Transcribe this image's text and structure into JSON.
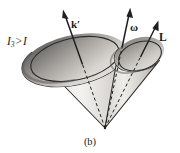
{
  "figure": {
    "caption": "(b)",
    "background_color": "#ffffff",
    "ink_color": "#1a1a1a",
    "labels": {
      "inequality": {
        "symbol": "I",
        "subscript": "3",
        "relation": ">",
        "compared_to": "I",
        "full_text": "I3 > I"
      },
      "vector_k_prime": "k′",
      "vector_omega": "ω",
      "vector_angular_momentum": "L"
    },
    "geometry": {
      "apex": {
        "x": 105,
        "y": 128
      },
      "space_cone": {
        "name": "space-cone",
        "rim_center": {
          "x": 75,
          "y": 59
        },
        "rim_rx": 45,
        "rim_ry": 21,
        "rim_rotation_deg": -12,
        "fill_light": "#f2f0ee",
        "fill_mid": "#b9b6b2",
        "fill_dark": "#6f6d6a"
      },
      "body_cone": {
        "name": "body-cone",
        "rim_center": {
          "x": 140,
          "y": 56
        },
        "rim_rx": 22,
        "rim_ry": 14,
        "rim_rotation_deg": -18,
        "fill_light": "#f4f2f0",
        "fill_mid": "#c2bfbb",
        "fill_dark": "#7a7875"
      },
      "arrows": [
        {
          "name": "k-prime-arrow",
          "label": "k′",
          "tail": {
            "x": 105,
            "y": 128
          },
          "tip": {
            "x": 63,
            "y": 10
          },
          "dashed_inside_cone": true
        },
        {
          "name": "omega-arrow",
          "label": "ω",
          "tail": {
            "x": 105,
            "y": 128
          },
          "tip": {
            "x": 130,
            "y": 8
          },
          "dashed_inside_cone": true
        },
        {
          "name": "angular-momentum-arrow",
          "label": "L",
          "tail": {
            "x": 105,
            "y": 128
          },
          "tip": {
            "x": 158,
            "y": 20
          },
          "dashed_inside_cone": true
        }
      ]
    }
  }
}
